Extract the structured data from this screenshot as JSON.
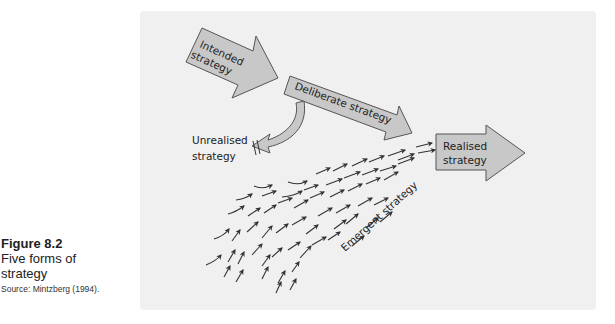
{
  "figure": {
    "number": "Figure 8.2",
    "title": "Five forms of strategy",
    "title_lines": [
      "Five forms of",
      "strategy"
    ],
    "source": "Source: Mintzberg (1994)."
  },
  "diagram": {
    "panel_color": "#f0f0f0",
    "arrow_fill": "#c8c8c8",
    "arrow_stroke": "#555555",
    "labels": {
      "intended": [
        "Intended",
        "strategy"
      ],
      "deliberate": "Deliberate strategy",
      "unrealised": [
        "Unrealised",
        "strategy"
      ],
      "realised": [
        "Realised",
        "strategy"
      ],
      "emergent": "Emergent strategy"
    },
    "nodes": [
      {
        "id": "intended",
        "label": "Intended strategy",
        "shape": "block-arrow"
      },
      {
        "id": "deliberate",
        "label": "Deliberate strategy",
        "shape": "block-arrow"
      },
      {
        "id": "unrealised",
        "label": "Unrealised strategy",
        "shape": "curved-arrow-blocked"
      },
      {
        "id": "emergent",
        "label": "Emergent strategy",
        "shape": "field-of-small-arrows"
      },
      {
        "id": "realised",
        "label": "Realised strategy",
        "shape": "block-arrow"
      }
    ],
    "edges": [
      {
        "from": "intended",
        "to": "deliberate"
      },
      {
        "from": "deliberate",
        "to": "unrealised"
      },
      {
        "from": "deliberate",
        "to": "realised"
      },
      {
        "from": "emergent",
        "to": "realised"
      }
    ]
  }
}
